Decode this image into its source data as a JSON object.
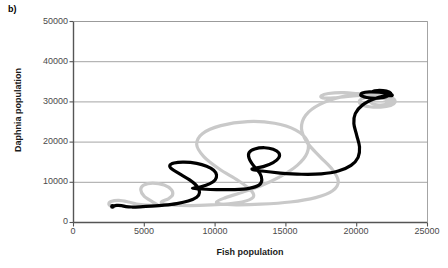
{
  "panel": {
    "label": "b)"
  },
  "chart_data": {
    "type": "line",
    "title": "",
    "subtitle": "",
    "xlabel": "Fish population",
    "ylabel": "Daphnia population",
    "xlim": [
      0,
      25000
    ],
    "ylim": [
      0,
      50000
    ],
    "xticks": [
      0,
      5000,
      10000,
      15000,
      20000,
      25000
    ],
    "xtick_labels": [
      "0",
      "5000",
      "10000",
      "15000",
      "20000",
      "25000"
    ],
    "yticks": [
      0,
      10000,
      20000,
      30000,
      40000,
      50000
    ],
    "ytick_labels": [
      "0",
      "10000",
      "20000",
      "30000",
      "40000",
      "50000"
    ],
    "grid": "horizontal",
    "legend": "none",
    "annotations": [],
    "colors": {
      "series_1": "#c9c9c9",
      "series_2": "#000000",
      "grid": "#9a9a9a",
      "axis": "#555555",
      "text": "#3d3d3d"
    },
    "series": [
      {
        "name": "trajectory-grey",
        "color": "#c9c9c9",
        "style": "solid",
        "width": 3.2,
        "description": "Outward-spiralling predator-prey phase trajectory converging to a large-amplitude limit cycle in the upper right",
        "points": [
          [
            2700,
            4050
          ],
          [
            2500,
            4500
          ],
          [
            2650,
            5200
          ],
          [
            3200,
            5500
          ],
          [
            3900,
            5100
          ],
          [
            4450,
            4600
          ],
          [
            5100,
            4350
          ],
          [
            5900,
            4350
          ],
          [
            5600,
            5100
          ],
          [
            5000,
            6500
          ],
          [
            4750,
            8100
          ],
          [
            4950,
            9300
          ],
          [
            5600,
            9800
          ],
          [
            6400,
            9300
          ],
          [
            6900,
            8200
          ],
          [
            7000,
            6900
          ],
          [
            6700,
            5900
          ],
          [
            6200,
            5100
          ],
          [
            6500,
            4500
          ],
          [
            7600,
            4250
          ],
          [
            8900,
            4250
          ],
          [
            10400,
            4500
          ],
          [
            11900,
            5100
          ],
          [
            12700,
            6300
          ],
          [
            12500,
            8100
          ],
          [
            11600,
            10500
          ],
          [
            10300,
            13300
          ],
          [
            9200,
            16400
          ],
          [
            8700,
            19400
          ],
          [
            9100,
            22100
          ],
          [
            10400,
            24100
          ],
          [
            12300,
            25100
          ],
          [
            14200,
            24700
          ],
          [
            15700,
            23000
          ],
          [
            16500,
            20400
          ],
          [
            16500,
            17300
          ],
          [
            15800,
            14200
          ],
          [
            14600,
            11400
          ],
          [
            13200,
            9100
          ],
          [
            11700,
            7300
          ],
          [
            10600,
            6000
          ],
          [
            10100,
            5100
          ],
          [
            10400,
            4600
          ],
          [
            11500,
            4400
          ],
          [
            13200,
            4550
          ],
          [
            15300,
            5100
          ],
          [
            17100,
            6200
          ],
          [
            18300,
            7900
          ],
          [
            18700,
            10200
          ],
          [
            18300,
            13100
          ],
          [
            17400,
            16400
          ],
          [
            16500,
            19900
          ],
          [
            16100,
            23400
          ],
          [
            16400,
            26700
          ],
          [
            17400,
            29400
          ],
          [
            19000,
            31300
          ],
          [
            20900,
            32100
          ],
          [
            22000,
            31700
          ],
          [
            22500,
            30400
          ],
          [
            22500,
            30000
          ],
          [
            21800,
            30900
          ],
          [
            20500,
            31800
          ],
          [
            19100,
            32300
          ],
          [
            18000,
            32100
          ],
          [
            17500,
            31500
          ],
          [
            17600,
            31000
          ],
          [
            18400,
            31000
          ],
          [
            19600,
            31400
          ],
          [
            21000,
            31800
          ],
          [
            22100,
            31600
          ],
          [
            22600,
            30800
          ],
          [
            22700,
            29900
          ],
          [
            22400,
            29100
          ],
          [
            21700,
            28700
          ],
          [
            20900,
            28800
          ],
          [
            20300,
            29400
          ],
          [
            20200,
            30300
          ],
          [
            20600,
            31100
          ],
          [
            21400,
            31500
          ],
          [
            22200,
            31300
          ],
          [
            22600,
            30600
          ],
          [
            22500,
            29800
          ],
          [
            22000,
            29300
          ],
          [
            21400,
            29300
          ],
          [
            21000,
            29800
          ],
          [
            21100,
            30500
          ],
          [
            21600,
            30900
          ],
          [
            22100,
            30700
          ],
          [
            22300,
            30200
          ],
          [
            22100,
            29800
          ]
        ]
      },
      {
        "name": "trajectory-black",
        "color": "#000000",
        "style": "solid",
        "width": 3.2,
        "description": "Outward-spiralling predator-prey phase trajectory with small loops at low population, converging to the upper right",
        "points": [
          [
            2750,
            4000
          ],
          [
            3050,
            4250
          ],
          [
            3400,
            4200
          ],
          [
            3700,
            3950
          ],
          [
            4100,
            3850
          ],
          [
            4700,
            3900
          ],
          [
            5500,
            4050
          ],
          [
            6400,
            4300
          ],
          [
            7300,
            4700
          ],
          [
            8100,
            5350
          ],
          [
            8700,
            6300
          ],
          [
            8900,
            7500
          ],
          [
            8750,
            8900
          ],
          [
            8200,
            10600
          ],
          [
            7500,
            12100
          ],
          [
            6950,
            13300
          ],
          [
            6800,
            14200
          ],
          [
            7100,
            14800
          ],
          [
            7800,
            15000
          ],
          [
            8700,
            14700
          ],
          [
            9400,
            14000
          ],
          [
            9900,
            13000
          ],
          [
            10100,
            11800
          ],
          [
            10000,
            10600
          ],
          [
            9600,
            9600
          ],
          [
            9000,
            8900
          ],
          [
            8400,
            8500
          ],
          [
            9000,
            8350
          ],
          [
            10100,
            8200
          ],
          [
            11400,
            8200
          ],
          [
            12400,
            8500
          ],
          [
            13100,
            9300
          ],
          [
            13300,
            10600
          ],
          [
            13150,
            12300
          ],
          [
            12700,
            14200
          ],
          [
            12400,
            16000
          ],
          [
            12400,
            17400
          ],
          [
            12800,
            18300
          ],
          [
            13500,
            18600
          ],
          [
            14100,
            18200
          ],
          [
            14500,
            17300
          ],
          [
            14500,
            16100
          ],
          [
            14100,
            14900
          ],
          [
            13400,
            13900
          ],
          [
            12600,
            13300
          ],
          [
            13300,
            12800
          ],
          [
            14600,
            12300
          ],
          [
            16100,
            12000
          ],
          [
            17500,
            12100
          ],
          [
            18700,
            12800
          ],
          [
            19600,
            14200
          ],
          [
            20100,
            16200
          ],
          [
            20200,
            18800
          ],
          [
            20000,
            21700
          ],
          [
            19800,
            24600
          ],
          [
            19900,
            27100
          ],
          [
            20400,
            29200
          ],
          [
            21200,
            30700
          ],
          [
            22000,
            31500
          ],
          [
            22500,
            31600
          ],
          [
            22300,
            32000
          ],
          [
            21600,
            32400
          ],
          [
            20900,
            32500
          ],
          [
            20400,
            32200
          ],
          [
            20300,
            31600
          ],
          [
            20700,
            31100
          ],
          [
            21300,
            30900
          ],
          [
            21900,
            31100
          ],
          [
            22300,
            31600
          ],
          [
            22400,
            32200
          ],
          [
            22100,
            32700
          ],
          [
            21600,
            32900
          ],
          [
            21200,
            32700
          ]
        ]
      }
    ]
  }
}
